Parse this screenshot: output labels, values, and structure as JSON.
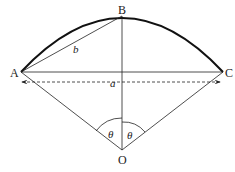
{
  "diagram": {
    "points": {
      "A": "A",
      "B": "B",
      "C": "C",
      "O": "O"
    },
    "labels": {
      "a": "a",
      "b": "b",
      "theta_left": "θ",
      "theta_right": "θ"
    },
    "colors": {
      "stroke": "#222222",
      "arc": "#111111"
    }
  }
}
